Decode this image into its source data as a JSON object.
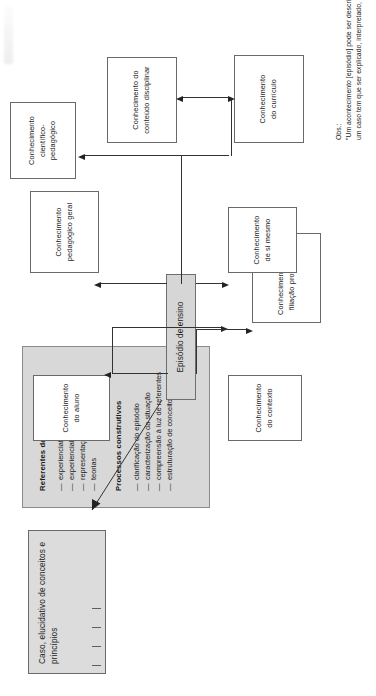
{
  "diagram": {
    "title_note_present": true,
    "central_node": {
      "label": "Episódio de ensino"
    },
    "case_node": {
      "label": "Caso, elucidativo de conceitos e princípios",
      "tick_count": 4
    },
    "knowledge_nodes": [
      {
        "id": "aluno",
        "label": "Conhecimento\ndo aluno"
      },
      {
        "id": "contexto",
        "label": "Conhecimento\ndo contexto"
      },
      {
        "id": "filiacao",
        "label": "Conhecimento da sua\nfiliação profissional"
      },
      {
        "id": "peda-geral",
        "label": "Conhecimento\npedagógico geral"
      },
      {
        "id": "si-mesmo",
        "label": "Conhecimento\nde si mesmo"
      },
      {
        "id": "cientifico",
        "label": "Conhecimento\ncientífico-pedagógico"
      },
      {
        "id": "conteudo",
        "label": "Conhecimento do\nconteúdo disciplinar"
      },
      {
        "id": "curriculo",
        "label": "Conhecimento\ndo currículo"
      }
    ],
    "legend": {
      "group_1": {
        "heading": "Referentes da construção",
        "items": [
          "experiencial pessoal",
          "experiencial profissional",
          "representações pessoais",
          "teorias"
        ]
      },
      "group_2": {
        "heading": "Processos construtivos",
        "items": [
          "clarificação do episódio",
          "caracterização da situação",
          "compreensão à luz de referentes",
          "estruturação de conceitos"
        ]
      }
    },
    "note": {
      "label": "Obs.:",
      "line_1": "\"Um acontecimento [episódio] pode ser descrito;",
      "line_2": "um caso tem que ser explicado, interpretado,"
    },
    "colors": {
      "node_border": "#6a6a6a",
      "central_fill": "#d6d6d6",
      "case_fill": "#dcdcdc",
      "legend_fill": "#d8d8d8",
      "line": "#333333",
      "text": "#1b1b1b",
      "page_background": "#ffffff"
    }
  }
}
